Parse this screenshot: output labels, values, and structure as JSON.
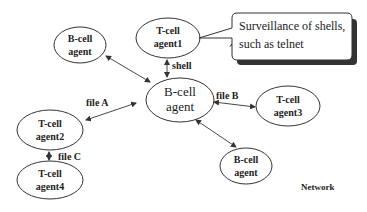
{
  "diagram": {
    "nodes": [
      {
        "id": "bcell_topleft",
        "line1": "B-cell",
        "line2": "agent",
        "cx": 80,
        "cy": 45,
        "rx": 26,
        "ry": 18,
        "style": "bold"
      },
      {
        "id": "tcell_agent1",
        "line1": "T-cell",
        "line2": "agent1",
        "cx": 168,
        "cy": 38,
        "rx": 32,
        "ry": 20,
        "style": "bold"
      },
      {
        "id": "bcell_center",
        "line1": "B-cell",
        "line2": "agent",
        "cx": 180,
        "cy": 100,
        "rx": 34,
        "ry": 22,
        "style": "plain"
      },
      {
        "id": "tcell_agent3",
        "line1": "T-cell",
        "line2": "agent3",
        "cx": 288,
        "cy": 106,
        "rx": 32,
        "ry": 20,
        "style": "bold"
      },
      {
        "id": "tcell_agent2",
        "line1": "T-cell",
        "line2": "agent2",
        "cx": 50,
        "cy": 130,
        "rx": 33,
        "ry": 20,
        "style": "bold"
      },
      {
        "id": "tcell_agent4",
        "line1": "T-cell",
        "line2": "agent4",
        "cx": 50,
        "cy": 180,
        "rx": 33,
        "ry": 19,
        "style": "bold"
      },
      {
        "id": "bcell_bottom",
        "line1": "B-cell",
        "line2": "agent",
        "cx": 246,
        "cy": 166,
        "rx": 26,
        "ry": 18,
        "style": "bold"
      }
    ],
    "edges": [
      {
        "from": "bcell_topleft",
        "to": "bcell_center",
        "label": ""
      },
      {
        "from": "tcell_agent1",
        "to": "bcell_center",
        "label": "shell"
      },
      {
        "from": "bcell_center",
        "to": "tcell_agent2",
        "label": "file A"
      },
      {
        "from": "bcell_center",
        "to": "tcell_agent3",
        "label": "file B"
      },
      {
        "from": "tcell_agent2",
        "to": "tcell_agent4",
        "label": "file C"
      },
      {
        "from": "bcell_center",
        "to": "bcell_bottom",
        "label": ""
      }
    ],
    "callout": {
      "line1": "Surveillance of shells,",
      "line2": "such as telnet"
    },
    "network_label": "Network"
  }
}
